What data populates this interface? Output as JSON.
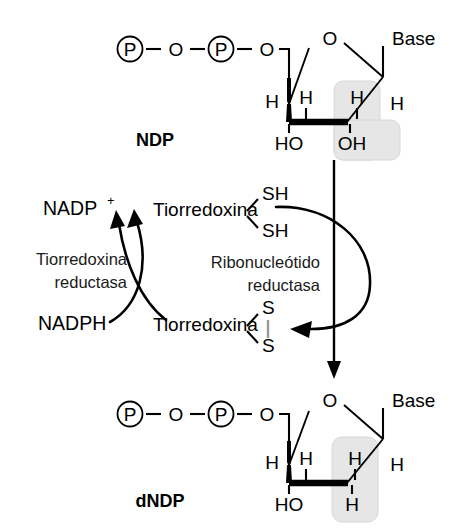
{
  "figure": {
    "language": "es",
    "background_color": "#ffffff",
    "ink_color": "#000000",
    "highlight_color": "#e6e6e6"
  },
  "substrate": {
    "label": "NDP",
    "phosphate_1": "P",
    "bridge_o": "O",
    "phosphate_2": "P",
    "ester_o": "O",
    "ring_o": "O",
    "base": "Base",
    "h_c4": "H",
    "h_c3": "H",
    "h_c2": "H",
    "h_c1": "H",
    "oh_c3": "HO",
    "oh_c2": "OH",
    "dash": "–",
    "highlight_group": "OH"
  },
  "product": {
    "label": "dNDP",
    "phosphate_1": "P",
    "bridge_o": "O",
    "phosphate_2": "P",
    "ester_o": "O",
    "ring_o": "O",
    "base": "Base",
    "h_c4": "H",
    "h_c3": "H",
    "h_c2_up": "H",
    "h_c1": "H",
    "oh_c3": "HO",
    "h_c2_down": "H",
    "dash": "–",
    "highlight_group": "H"
  },
  "cycle": {
    "nadp_plus": "NADP",
    "nadp_plus_sup": "+",
    "nadph": "NADPH",
    "thioredoxin_reduced": "Tiorredoxina",
    "thioredoxin_oxidized": "Tiorredoxina",
    "sh_top": "SH",
    "sh_bottom": "SH",
    "s_top": "S",
    "s_bottom": "S",
    "enzyme_left_line1": "Tiorredoxina",
    "enzyme_left_line2": "reductasa",
    "enzyme_right_line1": "Ribonucleótido",
    "enzyme_right_line2": "reductasa"
  }
}
